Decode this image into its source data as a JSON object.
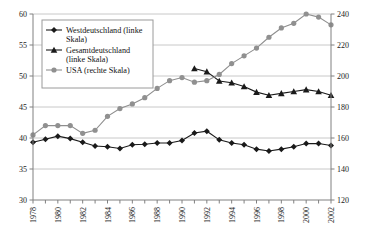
{
  "chart_data": {
    "type": "line",
    "title": "",
    "xlabel": "",
    "ylabel": "",
    "grid": true,
    "legend_position": "top-left",
    "x": [
      1978,
      1979,
      1980,
      1981,
      1982,
      1983,
      1984,
      1985,
      1986,
      1987,
      1988,
      1989,
      1990,
      1991,
      1992,
      1993,
      1994,
      1995,
      1996,
      1997,
      1998,
      1999,
      2000,
      2001,
      2002
    ],
    "xtick_labels": [
      "1978",
      "1980",
      "1982",
      "1984",
      "1986",
      "1988",
      "1990",
      "1992",
      "1994",
      "1996",
      "1998",
      "2000",
      "2002"
    ],
    "xtick_values": [
      1978,
      1980,
      1982,
      1984,
      1986,
      1988,
      1990,
      1992,
      1994,
      1996,
      1998,
      2000,
      2002
    ],
    "left_axis": {
      "min": 30,
      "max": 60,
      "ticks": [
        30,
        35,
        40,
        45,
        50,
        55,
        60
      ],
      "tick_labels": [
        "30",
        "35",
        "40",
        "45",
        "50",
        "55",
        "60"
      ]
    },
    "right_axis": {
      "min": 120,
      "max": 240,
      "ticks": [
        120,
        140,
        160,
        180,
        200,
        220,
        240
      ],
      "tick_labels": [
        "120",
        "140",
        "160",
        "180",
        "200",
        "220",
        "240"
      ]
    },
    "series": [
      {
        "name": "Westdeutschland (linke Skala)",
        "axis": "left",
        "marker": "diamond",
        "color": "#1a1a1a",
        "x": [
          1978,
          1979,
          1980,
          1981,
          1982,
          1983,
          1984,
          1985,
          1986,
          1987,
          1988,
          1989,
          1990,
          1991,
          1992,
          1993,
          1994,
          1995,
          1996,
          1997,
          1998,
          1999,
          2000,
          2001,
          2002
        ],
        "values": [
          39.3,
          39.8,
          40.3,
          39.9,
          39.3,
          38.7,
          38.6,
          38.3,
          38.9,
          39.0,
          39.2,
          39.2,
          39.6,
          40.8,
          41.1,
          39.7,
          39.2,
          38.9,
          38.2,
          37.9,
          38.2,
          38.6,
          39.1,
          39.1,
          38.8
        ]
      },
      {
        "name": "Gesamtdeutschland (linke Skala)",
        "axis": "left",
        "marker": "triangle",
        "color": "#1a1a1a",
        "x": [
          1991,
          1992,
          1993,
          1994,
          1995,
          1996,
          1997,
          1998,
          1999,
          2000,
          2001,
          2002
        ],
        "values": [
          51.2,
          50.7,
          49.2,
          48.9,
          48.3,
          47.4,
          46.9,
          47.2,
          47.5,
          47.8,
          47.5,
          46.9
        ]
      },
      {
        "name": "USA (rechte Skala)",
        "axis": "right",
        "marker": "circle",
        "color": "#909090",
        "x": [
          1978,
          1979,
          1980,
          1981,
          1982,
          1983,
          1984,
          1985,
          1986,
          1987,
          1988,
          1989,
          1990,
          1991,
          1992,
          1993,
          1994,
          1995,
          1996,
          1997,
          1998,
          1999,
          2000,
          2001,
          2002
        ],
        "values": [
          162,
          168,
          168,
          168,
          163,
          165,
          174,
          179,
          182,
          186,
          192,
          197,
          199,
          196,
          197,
          201,
          208,
          213,
          218,
          225,
          231,
          234,
          240,
          238,
          233
        ]
      }
    ],
    "legend": [
      {
        "label": "Westdeutschland (linke Skala)",
        "marker": "diamond",
        "color": "#1a1a1a"
      },
      {
        "label": "Gesamtdeutschland (linke Skala)",
        "marker": "triangle",
        "color": "#1a1a1a"
      },
      {
        "label": "USA (rechte Skala)",
        "marker": "circle",
        "color": "#909090"
      }
    ]
  }
}
